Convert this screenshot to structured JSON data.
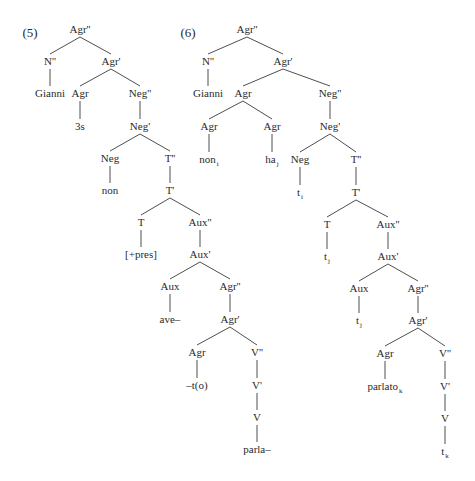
{
  "figure": {
    "examples": [
      {
        "label": "(5)",
        "tree": {
          "id": "a5_agrP",
          "text": "Agr''",
          "children": [
            {
              "id": "a5_np",
              "text": "N''",
              "children": [
                {
                  "id": "a5_gianni",
                  "text": "Gianni"
                }
              ]
            },
            {
              "id": "a5_agrbar",
              "text": "Agr'",
              "children": [
                {
                  "id": "a5_agr",
                  "text": "Agr",
                  "children": [
                    {
                      "id": "a5_3s",
                      "text": "3s"
                    }
                  ]
                },
                {
                  "id": "a5_negP",
                  "text": "Neg''",
                  "children": [
                    {
                      "id": "a5_negbar",
                      "text": "Neg'",
                      "children": [
                        {
                          "id": "a5_neg",
                          "text": "Neg",
                          "children": [
                            {
                              "id": "a5_non",
                              "text": "non"
                            }
                          ]
                        },
                        {
                          "id": "a5_tP",
                          "text": "T''",
                          "children": [
                            {
                              "id": "a5_tbar",
                              "text": "T'",
                              "children": [
                                {
                                  "id": "a5_t",
                                  "text": "T",
                                  "children": [
                                    {
                                      "id": "a5_pres",
                                      "text": "[+pres]"
                                    }
                                  ]
                                },
                                {
                                  "id": "a5_auxP",
                                  "text": "Aux''",
                                  "children": [
                                    {
                                      "id": "a5_auxbar",
                                      "text": "Aux'",
                                      "children": [
                                        {
                                          "id": "a5_aux",
                                          "text": "Aux",
                                          "children": [
                                            {
                                              "id": "a5_ave",
                                              "text": "ave–"
                                            }
                                          ]
                                        },
                                        {
                                          "id": "a5_agrP2",
                                          "text": "Agr''",
                                          "children": [
                                            {
                                              "id": "a5_agrbar2",
                                              "text": "Agr'",
                                              "children": [
                                                {
                                                  "id": "a5_agr2",
                                                  "text": "Agr",
                                                  "children": [
                                                    {
                                                      "id": "a5_to",
                                                      "text": "–t(o)"
                                                    }
                                                  ]
                                                },
                                                {
                                                  "id": "a5_vP",
                                                  "text": "V''",
                                                  "children": [
                                                    {
                                                      "id": "a5_vbar",
                                                      "text": "V'",
                                                      "children": [
                                                        {
                                                          "id": "a5_v",
                                                          "text": "V",
                                                          "children": [
                                                            {
                                                              "id": "a5_parla",
                                                              "text": "parla–"
                                                            }
                                                          ]
                                                        }
                                                      ]
                                                    }
                                                  ]
                                                }
                                              ]
                                            }
                                          ]
                                        }
                                      ]
                                    }
                                  ]
                                }
                              ]
                            }
                          ]
                        }
                      ]
                    }
                  ]
                }
              ]
            }
          ]
        }
      },
      {
        "label": "(6)",
        "tree": {
          "id": "a6_agrP",
          "text": "Agr''",
          "children": [
            {
              "id": "a6_np",
              "text": "N''",
              "children": [
                {
                  "id": "a6_gianni",
                  "text": "Gianni"
                }
              ]
            },
            {
              "id": "a6_agrbar",
              "text": "Agr'",
              "children": [
                {
                  "id": "a6_agr",
                  "text": "Agr",
                  "children": [
                    {
                      "id": "a6_agrL",
                      "text": "Agr",
                      "children": [
                        {
                          "id": "a6_non",
                          "text": "non",
                          "sub": "i"
                        }
                      ]
                    },
                    {
                      "id": "a6_agrR",
                      "text": "Agr",
                      "children": [
                        {
                          "id": "a6_ha",
                          "text": "ha",
                          "sub": "j"
                        }
                      ]
                    }
                  ]
                },
                {
                  "id": "a6_negP",
                  "text": "Neg''",
                  "children": [
                    {
                      "id": "a6_negbar",
                      "text": "Neg'",
                      "children": [
                        {
                          "id": "a6_neg",
                          "text": "Neg",
                          "children": [
                            {
                              "id": "a6_ti",
                              "text": "t",
                              "sub": "i"
                            }
                          ]
                        },
                        {
                          "id": "a6_tP",
                          "text": "T''",
                          "children": [
                            {
                              "id": "a6_tbar",
                              "text": "T'",
                              "children": [
                                {
                                  "id": "a6_t",
                                  "text": "T",
                                  "children": [
                                    {
                                      "id": "a6_tj1",
                                      "text": "t",
                                      "sub": "j"
                                    }
                                  ]
                                },
                                {
                                  "id": "a6_auxP",
                                  "text": "Aux''",
                                  "children": [
                                    {
                                      "id": "a6_auxbar",
                                      "text": "Aux'",
                                      "children": [
                                        {
                                          "id": "a6_aux",
                                          "text": "Aux",
                                          "children": [
                                            {
                                              "id": "a6_tj2",
                                              "text": "t",
                                              "sub": "j"
                                            }
                                          ]
                                        },
                                        {
                                          "id": "a6_agrP2",
                                          "text": "Agr''",
                                          "children": [
                                            {
                                              "id": "a6_agrbar2",
                                              "text": "Agr'",
                                              "children": [
                                                {
                                                  "id": "a6_agr2",
                                                  "text": "Agr",
                                                  "children": [
                                                    {
                                                      "id": "a6_parlato",
                                                      "text": "parlato",
                                                      "sub": "k"
                                                    }
                                                  ]
                                                },
                                                {
                                                  "id": "a6_vP",
                                                  "text": "V''",
                                                  "children": [
                                                    {
                                                      "id": "a6_vbar",
                                                      "text": "V'",
                                                      "children": [
                                                        {
                                                          "id": "a6_v",
                                                          "text": "V",
                                                          "children": [
                                                            {
                                                              "id": "a6_tk",
                                                              "text": "t",
                                                              "sub": "k"
                                                            }
                                                          ]
                                                        }
                                                      ]
                                                    }
                                                  ]
                                                }
                                              ]
                                            }
                                          ]
                                        }
                                      ]
                                    }
                                  ]
                                }
                              ]
                            }
                          ]
                        }
                      ]
                    }
                  ]
                }
              ]
            }
          ]
        }
      }
    ]
  }
}
